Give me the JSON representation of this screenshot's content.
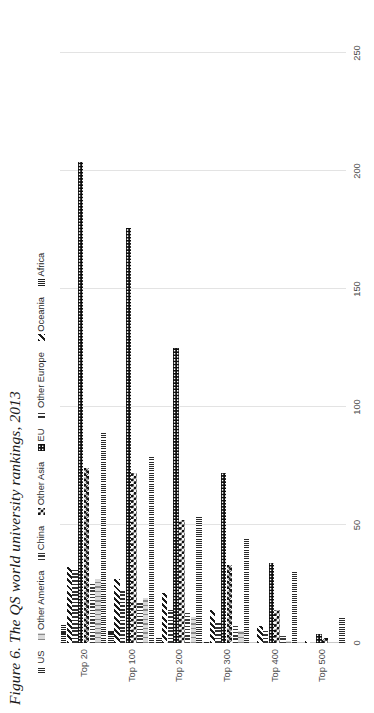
{
  "figure": {
    "title": "Figure 6. The QS world university rankings, 2013"
  },
  "chart_data": {
    "type": "bar",
    "orientation": "horizontal",
    "title": "Figure 6. The QS world university rankings, 2013",
    "xlabel": "",
    "ylabel": "",
    "xlim": [
      0,
      250
    ],
    "xticks": [
      "0",
      "50",
      "100",
      "150",
      "200",
      "250"
    ],
    "grid": true,
    "legend_position": "top",
    "categories": [
      "Top 20",
      "Top 100",
      "Top 200",
      "Top 300",
      "Top 400",
      "Top 500"
    ],
    "series": [
      {
        "name": "US",
        "pattern": "us",
        "values": [
          11,
          31,
          44,
          54,
          79,
          89
        ]
      },
      {
        "name": "Other America",
        "pattern": "otheramerica",
        "values": [
          0,
          1,
          5,
          11,
          19,
          27
        ]
      },
      {
        "name": "China",
        "pattern": "china",
        "values": [
          0,
          3,
          8,
          13,
          18,
          25
        ]
      },
      {
        "name": "Other Asia",
        "pattern": "otherasia",
        "values": [
          2,
          14,
          33,
          52,
          72,
          74
        ]
      },
      {
        "name": "EU",
        "pattern": "eu",
        "values": [
          4,
          34,
          72,
          125,
          176,
          204
        ]
      },
      {
        "name": "Other Europe",
        "pattern": "othereurope",
        "values": [
          0,
          5,
          9,
          14,
          22,
          31
        ]
      },
      {
        "name": "Oceania",
        "pattern": "oceania",
        "values": [
          1,
          7,
          14,
          21,
          27,
          32
        ]
      },
      {
        "name": "Africa",
        "pattern": "africa",
        "values": [
          0,
          0,
          1,
          2,
          5,
          8
        ]
      }
    ]
  },
  "legend": {
    "items": [
      {
        "label": "US",
        "pattern": "us"
      },
      {
        "label": "Other America",
        "pattern": "otheramerica"
      },
      {
        "label": "China",
        "pattern": "china"
      },
      {
        "label": "Other Asia",
        "pattern": "otherasia"
      },
      {
        "label": "EU",
        "pattern": "eu"
      },
      {
        "label": "Other Europe",
        "pattern": "othereurope"
      },
      {
        "label": "Oceania",
        "pattern": "oceania"
      },
      {
        "label": "Africa",
        "pattern": "africa"
      }
    ]
  },
  "axis": {
    "ticks": [
      "0",
      "50",
      "100",
      "150",
      "200",
      "250"
    ],
    "max": 250
  }
}
